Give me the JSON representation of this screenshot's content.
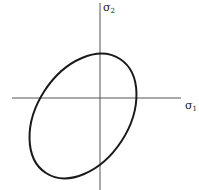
{
  "figure": {
    "type": "stress-space ellipse (yield locus)",
    "axes": {
      "horizontal": {
        "label": "σ",
        "subscript": "1"
      },
      "vertical": {
        "label": "σ",
        "subscript": "2"
      }
    },
    "curve": {
      "shape": "ellipse",
      "orientation": "tilted along σ1 = σ2 direction",
      "stroke": "#1a1a1a"
    },
    "axis_color": "#555555"
  }
}
